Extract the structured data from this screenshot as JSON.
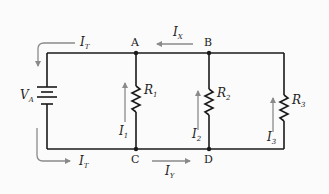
{
  "diagram": {
    "type": "parallel-circuit",
    "colors": {
      "wire": "#1a1a1a",
      "arrow": "#8a8a8a",
      "background": "#fbfbfb"
    },
    "source": {
      "label": "V",
      "subscript": "A"
    },
    "nodes": [
      {
        "id": "A",
        "label": "A"
      },
      {
        "id": "B",
        "label": "B"
      },
      {
        "id": "C",
        "label": "C"
      },
      {
        "id": "D",
        "label": "D"
      }
    ],
    "resistors": [
      {
        "label": "R",
        "subscript": "1"
      },
      {
        "label": "R",
        "subscript": "2"
      },
      {
        "label": "R",
        "subscript": "3"
      }
    ],
    "currents": {
      "total_top": {
        "label": "I",
        "subscript": "T"
      },
      "total_bottom": {
        "label": "I",
        "subscript": "T"
      },
      "x": {
        "label": "I",
        "subscript": "X"
      },
      "y": {
        "label": "I",
        "subscript": "Y"
      },
      "branch1": {
        "label": "I",
        "subscript": "1"
      },
      "branch2": {
        "label": "I",
        "subscript": "2"
      },
      "branch3": {
        "label": "I",
        "subscript": "3"
      }
    }
  }
}
